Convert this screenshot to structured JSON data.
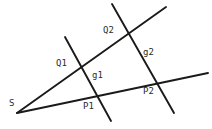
{
  "figure": {
    "type": "geometry-diagram",
    "width": 212,
    "height": 129,
    "background_color": "#ffffff",
    "stroke_color": "#1a1a1a",
    "label_color": "#2b2b2b"
  },
  "labels": [
    {
      "id": "S",
      "text": "S",
      "x": 9,
      "y": 99
    },
    {
      "id": "Q1",
      "text": "Q1",
      "x": 56,
      "y": 59
    },
    {
      "id": "Q2",
      "text": "Q2",
      "x": 103,
      "y": 26
    },
    {
      "id": "g1",
      "text": "g1",
      "x": 92,
      "y": 71
    },
    {
      "id": "g2",
      "text": "g2",
      "x": 143,
      "y": 48
    },
    {
      "id": "P1",
      "text": "P1",
      "x": 83,
      "y": 102
    },
    {
      "id": "P2",
      "text": "P2",
      "x": 143,
      "y": 87
    }
  ],
  "points": [
    {
      "id": "S",
      "x": 17,
      "y": 113
    },
    {
      "id": "Q1",
      "x": 78,
      "y": 64
    },
    {
      "id": "Q2",
      "x": 126,
      "y": 31
    },
    {
      "id": "P1",
      "x": 97,
      "y": 97
    },
    {
      "id": "P2",
      "x": 159,
      "y": 83
    }
  ],
  "lines": [
    {
      "id": "ray-upper",
      "name": "ray-s-through-q1-q2",
      "x1": 17,
      "y1": 113,
      "x2": 166,
      "y2": 7
    },
    {
      "id": "ray-lower",
      "name": "ray-s-through-p1-p2",
      "x1": 17,
      "y1": 113,
      "x2": 208,
      "y2": 73
    },
    {
      "id": "g1",
      "name": "transversal-g1",
      "x1": 65,
      "y1": 37,
      "x2": 111,
      "y2": 121
    },
    {
      "id": "g2",
      "name": "transversal-g2",
      "x1": 112,
      "y1": 4,
      "x2": 174,
      "y2": 113
    }
  ]
}
